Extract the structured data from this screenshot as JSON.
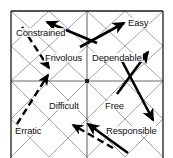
{
  "diagram": {
    "type": "quadrant-vector-diagram",
    "frame": {
      "left": 11,
      "top": 11,
      "right": 163,
      "bottom": 168,
      "note": "bottom edge cropped by image border"
    },
    "grid": {
      "rows": 2,
      "cols": 2,
      "center_x": 87,
      "center_y": 81,
      "lattice": "each quadrant subdivided 2x2 with full X diagonals",
      "line_color": "#8e8e8e",
      "frame_color": "#1a1a1a"
    },
    "labels": [
      {
        "id": "constrained",
        "text": "Constrained",
        "x": 15,
        "y": 28,
        "quadrant": "top-left"
      },
      {
        "id": "easy",
        "text": "Easy",
        "x": 127,
        "y": 18,
        "quadrant": "top-right"
      },
      {
        "id": "frivolous",
        "text": "Frivolous",
        "x": 44,
        "y": 53,
        "quadrant": "top-left"
      },
      {
        "id": "dependable",
        "text": "Dependable",
        "x": 91,
        "y": 53,
        "quadrant": "top-right"
      },
      {
        "id": "difficult",
        "text": "Difficult",
        "x": 48,
        "y": 101,
        "quadrant": "bottom-left"
      },
      {
        "id": "free",
        "text": "Free",
        "x": 104,
        "y": 101,
        "quadrant": "bottom-right"
      },
      {
        "id": "erratic",
        "text": "Erratic",
        "x": 14,
        "y": 126,
        "quadrant": "bottom-left"
      },
      {
        "id": "responsible",
        "text": "Responsible",
        "x": 107,
        "y": 126,
        "quadrant": "bottom-right"
      }
    ],
    "vectors": [
      {
        "id": "vector-constrained",
        "style": "solid",
        "x1": 97,
        "y1": 43,
        "x2": 45,
        "y2": 21,
        "label": "Constrained"
      },
      {
        "id": "vector-easy",
        "style": "solid",
        "x1": 80,
        "y1": 47,
        "x2": 126,
        "y2": 22,
        "label": "Easy"
      },
      {
        "id": "vector-frivolous",
        "style": "dashed",
        "x1": 22,
        "y1": 27,
        "x2": 50,
        "y2": 70,
        "label": "Frivolous"
      },
      {
        "id": "vector-dependable",
        "style": "solid",
        "x1": 117,
        "y1": 94,
        "x2": 150,
        "y2": 50,
        "label": "Dependable"
      },
      {
        "id": "vector-difficult",
        "style": "dashed",
        "x1": 17,
        "y1": 124,
        "x2": 50,
        "y2": 73,
        "label": "Difficult"
      },
      {
        "id": "vector-free",
        "style": "solid",
        "x1": 122,
        "y1": 61,
        "x2": 155,
        "y2": 124,
        "label": "Free"
      },
      {
        "id": "vector-erratic",
        "style": "dashed",
        "x1": 113,
        "y1": 148,
        "x2": 71,
        "y2": 124,
        "label": "Erratic"
      },
      {
        "id": "vector-responsible",
        "style": "solid",
        "x1": 128,
        "y1": 153,
        "x2": 86,
        "y2": 122,
        "label": "Responsible"
      }
    ],
    "colors": {
      "background": "#ffffff",
      "frame": "#1a1a1a",
      "lattice": "#8e8e8e",
      "arrow": "#000000",
      "text": "#101010"
    }
  }
}
